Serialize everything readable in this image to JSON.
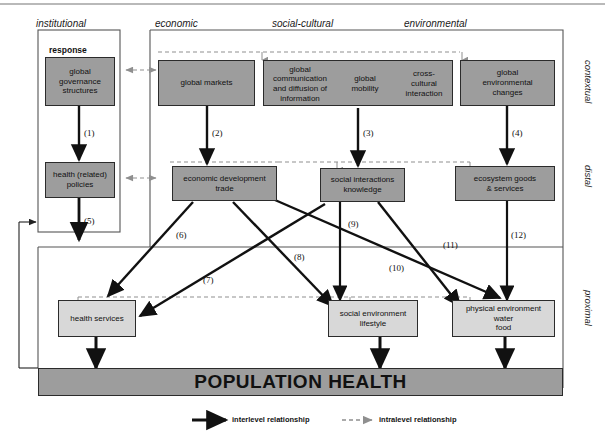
{
  "diagram": {
    "title_bar_text": "POPULATION HEALTH",
    "column_labels": [
      {
        "key": "institutional",
        "label": "institutional"
      },
      {
        "key": "economic",
        "label": "economic"
      },
      {
        "key": "social_cultural",
        "label": "social-cultural"
      },
      {
        "key": "environmental",
        "label": "environmental"
      }
    ],
    "level_labels": [
      {
        "key": "contextual",
        "label": "contextual"
      },
      {
        "key": "distal",
        "label": "distal"
      },
      {
        "key": "proximal",
        "label": "proximal"
      }
    ],
    "response_label": "response",
    "nodes": {
      "global_governance": "global governance structures",
      "health_policies": "health (related) policies",
      "global_markets": "global markets",
      "global_communication": "global communication and diffusion of information",
      "global_mobility": "global mobility",
      "cross_cultural": "cross-cultural interaction",
      "global_env_changes": "global environmental changes",
      "economic_development": "economic development trade",
      "social_interactions": "social interactions knowledge",
      "ecosystem_goods": "ecosystem goods & services",
      "health_services": "health services",
      "social_environment": "social environment lifestyle",
      "physical_environment": "physical environment water food"
    },
    "node_lines": {
      "global_governance": [
        "global",
        "governance",
        "structures"
      ],
      "health_policies": [
        "health (related)",
        "policies"
      ],
      "global_markets": [
        "global markets"
      ],
      "global_communication": [
        "global",
        "communication",
        "and diffusion of",
        "information"
      ],
      "global_mobility": [
        "global",
        "mobility"
      ],
      "cross_cultural": [
        "cross-",
        "cultural",
        "interaction"
      ],
      "global_env_changes": [
        "global",
        "environmental",
        "changes"
      ],
      "economic_development": [
        "economic development",
        "trade"
      ],
      "social_interactions": [
        "social interactions",
        "knowledge"
      ],
      "ecosystem_goods": [
        "ecosystem goods",
        "& services"
      ],
      "health_services": [
        "health services"
      ],
      "social_environment": [
        "social environment",
        "lifestyle"
      ],
      "physical_environment": [
        "physical environment",
        "water",
        "food"
      ]
    },
    "relationship_numbers": [
      {
        "id": "1",
        "label": "(1)"
      },
      {
        "id": "2",
        "label": "(2)"
      },
      {
        "id": "3",
        "label": "(3)"
      },
      {
        "id": "4",
        "label": "(4)"
      },
      {
        "id": "5",
        "label": "(5)"
      },
      {
        "id": "6",
        "label": "(6)"
      },
      {
        "id": "7",
        "label": "(7)"
      },
      {
        "id": "8",
        "label": "(8)"
      },
      {
        "id": "9",
        "label": "(9)"
      },
      {
        "id": "10",
        "label": "(10)"
      },
      {
        "id": "11",
        "label": "(11)"
      },
      {
        "id": "12",
        "label": "(12)"
      }
    ],
    "legend": {
      "interlevel": "interlevel relationship",
      "intralevel": "intralevel relationship"
    },
    "colors": {
      "dark_box_fill": "#9d9d9d",
      "light_box_fill": "#d8d8d8",
      "stroke": "#2b2b2b",
      "intralevel_arrow": "#8f8f8f",
      "frame": "#555555"
    }
  }
}
